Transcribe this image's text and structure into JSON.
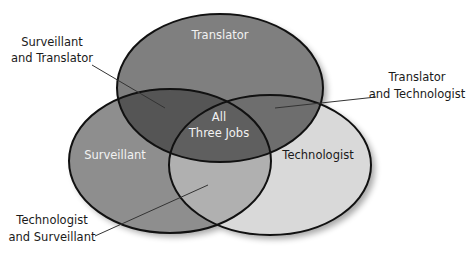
{
  "diagram": {
    "type": "venn",
    "sets": [
      {
        "id": "translator",
        "label": "Translator",
        "cx": 220,
        "cy": 88,
        "rx": 103,
        "ry": 74,
        "color": "#7f7f7f"
      },
      {
        "id": "surveillant",
        "label": "Surveillant",
        "cx": 170,
        "cy": 161,
        "rx": 101,
        "ry": 72,
        "color": "#8e8e8e"
      },
      {
        "id": "technologist",
        "label": "Technologist",
        "cx": 270,
        "cy": 165,
        "rx": 101,
        "ry": 70,
        "color": "#d9d9d9"
      }
    ],
    "regions": {
      "surveillant_translator": {
        "color": "#555555"
      },
      "translator_technologist": {
        "color": "#6e6e6e"
      },
      "technologist_surveillant": {
        "color": "#b0b0b0"
      },
      "all_three": {
        "color": "#5f5f5f"
      }
    },
    "center_label": {
      "line1": "All",
      "line2": "Three Jobs"
    },
    "callouts": {
      "surveillant_translator": {
        "line1": "Surveillant",
        "line2": "and Translator"
      },
      "translator_technologist": {
        "line1": "Translator",
        "line2": "and Technologist"
      },
      "technologist_surveillant": {
        "line1": "Technologist",
        "line2": "and Surveillant"
      }
    },
    "outline_color": "#111111"
  }
}
